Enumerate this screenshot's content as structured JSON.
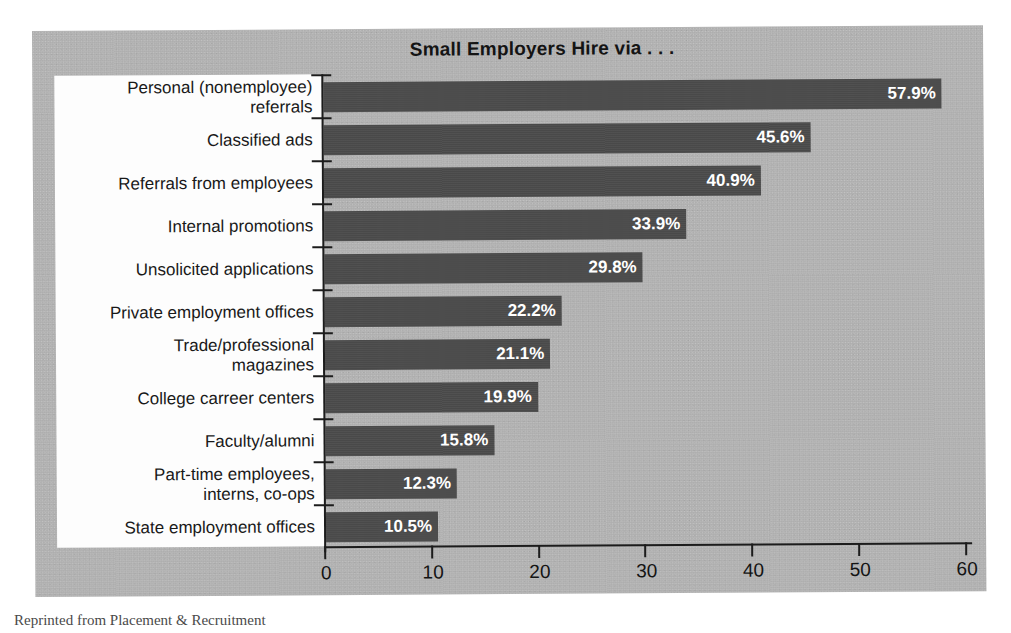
{
  "chart_data": {
    "type": "bar",
    "orientation": "horizontal",
    "title": "Small Employers Hire via . . .",
    "xlabel": "",
    "ylabel": "",
    "xlim": [
      0,
      60
    ],
    "xticks": [
      0,
      10,
      20,
      30,
      40,
      50,
      60
    ],
    "xtick_labels": [
      "0",
      "10",
      "20",
      "30",
      "40",
      "50",
      "60"
    ],
    "grid": false,
    "legend": null,
    "value_label_suffix": "%",
    "categories": [
      "Personal (nonemployee)\nreferrals",
      "Classified ads",
      "Referrals from employees",
      "Internal promotions",
      "Unsolicited applications",
      "Private employment offices",
      "Trade/professional\nmagazines",
      "College carreer centers",
      "Faculty/alumni",
      "Part-time employees,\ninterns, co-ops",
      "State employment offices"
    ],
    "values": [
      57.9,
      45.6,
      40.9,
      33.9,
      29.8,
      22.2,
      21.1,
      19.9,
      15.8,
      12.3,
      10.5
    ],
    "value_labels": [
      "57.9%",
      "45.6%",
      "40.9%",
      "33.9%",
      "29.8%",
      "22.2%",
      "21.1%",
      "19.9%",
      "15.8%",
      "12.3%",
      "10.5%"
    ],
    "colors": {
      "bar": "#4b4b4b",
      "plot_background": "#b4b4b4",
      "label_panel_background": "#fdfdfd",
      "axis": "#1c1c1c",
      "value_label_text": "#ffffff",
      "title_text": "#141414",
      "category_text": "#191919",
      "page_background": "#ffffff"
    }
  },
  "caption": {
    "text": "Reprinted from Placement & Recruitment"
  }
}
